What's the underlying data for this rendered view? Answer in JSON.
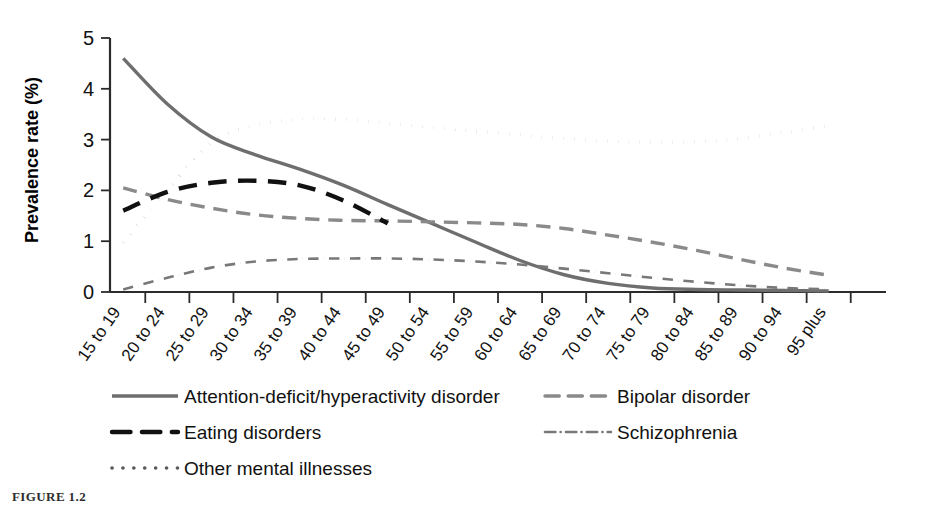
{
  "figure": {
    "caption": "FIGURE 1.2"
  },
  "chart_data": {
    "type": "line",
    "title": "",
    "xlabel": "",
    "ylabel": "Prevalence rate (%)",
    "ylim": [
      0,
      5
    ],
    "yticks": [
      "0",
      "1",
      "2",
      "3",
      "4",
      "5"
    ],
    "grid": false,
    "legend_position": "below",
    "categories": [
      "15 to 19",
      "20 to 24",
      "25 to 29",
      "30 to 34",
      "35 to 39",
      "40 to 44",
      "45 to 49",
      "50 to 54",
      "55 to 59",
      "60 to 64",
      "65 to 69",
      "70 to 74",
      "75 to 79",
      "80 to 84",
      "85 to 89",
      "90 to 94",
      "95 plus"
    ],
    "series": [
      {
        "name": "Attention-deficit/hyperactivity disorder",
        "style": "solid",
        "color": "#6e6e6e",
        "values": [
          4.6,
          3.7,
          3.05,
          2.7,
          2.42,
          2.1,
          1.72,
          1.35,
          0.98,
          0.62,
          0.34,
          0.17,
          0.08,
          0.05,
          0.04,
          0.03,
          0.02
        ]
      },
      {
        "name": "Bipolar disorder",
        "style": "dashed",
        "color": "#8a8a8a",
        "values": [
          2.05,
          1.82,
          1.65,
          1.52,
          1.45,
          1.41,
          1.4,
          1.38,
          1.36,
          1.33,
          1.25,
          1.12,
          0.98,
          0.82,
          0.64,
          0.47,
          0.33
        ]
      },
      {
        "name": "Eating disorders",
        "style": "dashed",
        "color": "#111111",
        "values": [
          1.6,
          1.97,
          2.15,
          2.19,
          2.1,
          1.8,
          1.35,
          null,
          null,
          null,
          null,
          null,
          null,
          null,
          null,
          null,
          null
        ]
      },
      {
        "name": "Schizophrenia",
        "style": "dashdot",
        "color": "#787878",
        "values": [
          0.05,
          0.28,
          0.48,
          0.6,
          0.65,
          0.66,
          0.66,
          0.64,
          0.6,
          0.54,
          0.46,
          0.37,
          0.28,
          0.2,
          0.13,
          0.08,
          0.05
        ]
      },
      {
        "name": "Other mental illnesses",
        "style": "dotted",
        "color": "#5a5a5a",
        "values": [
          0.98,
          2.0,
          2.95,
          3.28,
          3.4,
          3.4,
          3.32,
          3.24,
          3.17,
          3.1,
          3.02,
          2.97,
          2.95,
          2.96,
          3.02,
          3.14,
          3.27
        ]
      }
    ],
    "legend": [
      {
        "label": "Attention-deficit/hyperactivity disorder",
        "style": "solid",
        "color": "#6e6e6e"
      },
      {
        "label": "Bipolar disorder",
        "style": "dashed",
        "color": "#8a8a8a"
      },
      {
        "label": "Eating disorders",
        "style": "dashed",
        "color": "#111111"
      },
      {
        "label": "Schizophrenia",
        "style": "dashdot",
        "color": "#787878"
      },
      {
        "label": "Other mental illnesses",
        "style": "dotted",
        "color": "#5a5a5a"
      }
    ]
  }
}
